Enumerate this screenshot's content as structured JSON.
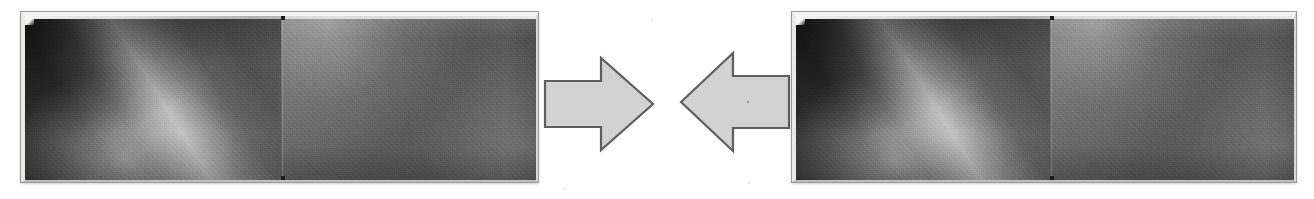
{
  "figure": {
    "caption": "",
    "background_color": "#ffffff",
    "width": 1314,
    "height": 199,
    "panel_count": 2,
    "arrow_count": 2,
    "relation": "convergence"
  },
  "panels": [
    {
      "id": "left-image-panel",
      "label": "",
      "x": 21,
      "y": 12,
      "width": 517,
      "height": 170,
      "frame_color": "#f4f4f2",
      "border_color": "#9a9a9a",
      "split_at_percent": 50,
      "halves": [
        {
          "id": "left-panel-left-half",
          "name": "dark-gradient-half",
          "description": "dark field with bright diagonal beam rising from lower-left",
          "dominant_color": "#333333",
          "highlight_color": "#e8e8e8",
          "beam_angle_deg": 58
        },
        {
          "id": "left-panel-right-half",
          "name": "flat-midgray-half",
          "description": "flatter mid-gray field, brighter near top-left corner",
          "dominant_color": "#5a5a5a",
          "highlight_color": "#7c7c7c"
        }
      ]
    },
    {
      "id": "right-image-panel",
      "label": "",
      "x": 792,
      "y": 12,
      "width": 504,
      "height": 170,
      "frame_color": "#f4f4f2",
      "border_color": "#9a9a9a",
      "split_at_percent": 51,
      "halves": [
        {
          "id": "right-panel-left-half",
          "name": "dark-gradient-half",
          "description": "dark field with bright diagonal beam rising from lower-left",
          "dominant_color": "#333333",
          "highlight_color": "#e8e8e8",
          "beam_angle_deg": 58
        },
        {
          "id": "right-panel-right-half",
          "name": "flat-midgray-half",
          "description": "flatter mid-gray field, brighter near top-left corner",
          "dominant_color": "#5a5a5a",
          "highlight_color": "#7c7c7c"
        }
      ]
    }
  ],
  "arrows": [
    {
      "id": "arrow-right",
      "direction": "right",
      "x": 543,
      "y": 55,
      "width": 112,
      "height": 98,
      "fill_color": "#d2d2d2",
      "outline_color": "#5e5e5e"
    },
    {
      "id": "arrow-left",
      "direction": "left",
      "x": 679,
      "y": 50,
      "width": 112,
      "height": 104,
      "fill_color": "#d2d2d2",
      "outline_color": "#5e5e5e"
    }
  ]
}
